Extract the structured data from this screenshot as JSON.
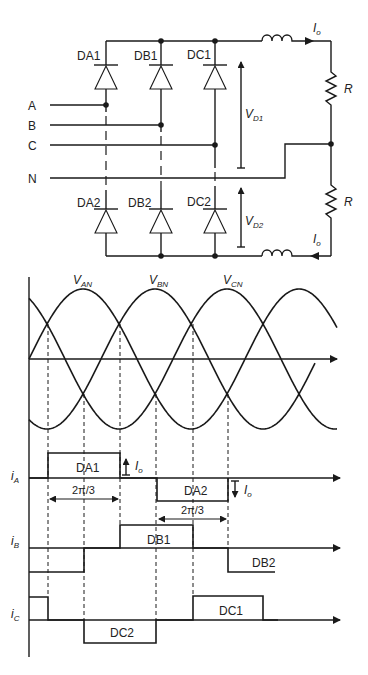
{
  "circuit": {
    "diodes_upper": [
      {
        "id": "DA1",
        "label": "DA1",
        "x": 106
      },
      {
        "id": "DB1",
        "label": "DB1",
        "x": 161
      },
      {
        "id": "DC1",
        "label": "DC1",
        "x": 215
      }
    ],
    "diodes_lower": [
      {
        "id": "DA2",
        "label": "DA2",
        "x": 106
      },
      {
        "id": "DB2",
        "label": "DB2",
        "x": 161
      },
      {
        "id": "DC2",
        "label": "DC2",
        "x": 215
      }
    ],
    "inputs": [
      {
        "label": "A",
        "y": 105
      },
      {
        "label": "B",
        "y": 125
      },
      {
        "label": "C",
        "y": 145
      },
      {
        "label": "N",
        "y": 178
      }
    ],
    "voltage_labels": {
      "vd1_main": "V",
      "vd1_sub": "D1",
      "vd2_main": "V",
      "vd2_sub": "D2"
    },
    "current_label_main": "I",
    "current_label_sub": "o",
    "resistor_label": "R"
  },
  "waveforms": {
    "voltage_labels": [
      {
        "main": "V",
        "sub": "AN"
      },
      {
        "main": "V",
        "sub": "BN"
      },
      {
        "main": "V",
        "sub": "CN"
      }
    ],
    "current_axes": [
      {
        "main": "i",
        "sub": "A"
      },
      {
        "main": "i",
        "sub": "B"
      },
      {
        "main": "i",
        "sub": "C"
      }
    ],
    "pulse_labels": {
      "da1": "DA1",
      "da2": "DA2",
      "db1": "DB1",
      "db2": "DB2",
      "dc1": "DC1",
      "dc2": "DC2"
    },
    "interval_label_1": "2π/3",
    "interval_label_2": "2π/3",
    "io_main": "I",
    "io_sub": "o"
  }
}
